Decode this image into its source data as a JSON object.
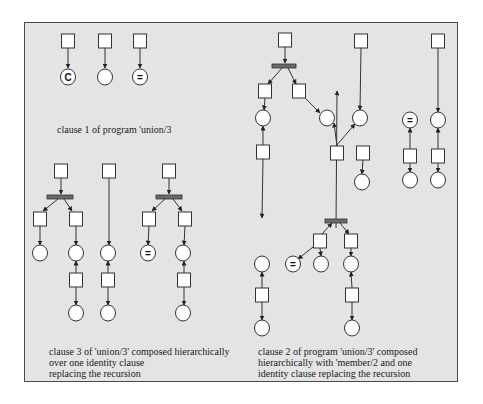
{
  "colors": {
    "frame_bg": "#e4e4e4",
    "stroke": "#333333",
    "node_fill": "#ffffff",
    "bar_fill": "#6a6a6a"
  },
  "captions": {
    "clause1": {
      "lines": [
        "clause 1 of program 'union/3"
      ],
      "x": 57,
      "y": 124
    },
    "clause3": {
      "lines": [
        "clause 3  of 'union/3' composed hierarchically",
        "over one identity clause",
        "replacing the recursion"
      ],
      "x": 49,
      "y": 346
    },
    "clause2": {
      "lines": [
        "clause 2 of program 'union/3' composed",
        "hierarchically with 'member/2 and one",
        "identity clause replacing the recursion"
      ],
      "x": 258,
      "y": 346
    }
  },
  "diagram": {
    "boxes": [
      {
        "id": "c1b1",
        "x": 68,
        "y": 41
      },
      {
        "id": "c1b2",
        "x": 105,
        "y": 41
      },
      {
        "id": "c1b3",
        "x": 140,
        "y": 41
      },
      {
        "id": "c3b1",
        "x": 61,
        "y": 171
      },
      {
        "id": "c3b2",
        "x": 40,
        "y": 219
      },
      {
        "id": "c3b3",
        "x": 76,
        "y": 219
      },
      {
        "id": "c3b4",
        "x": 76,
        "y": 280
      },
      {
        "id": "c3b5",
        "x": 109,
        "y": 171
      },
      {
        "id": "c3b6",
        "x": 108,
        "y": 280
      },
      {
        "id": "c3b7",
        "x": 169,
        "y": 171
      },
      {
        "id": "c3b8",
        "x": 149,
        "y": 219
      },
      {
        "id": "c3b9",
        "x": 185,
        "y": 219
      },
      {
        "id": "c3b10",
        "x": 184,
        "y": 280
      },
      {
        "id": "c2b1",
        "x": 285,
        "y": 40
      },
      {
        "id": "c2b2",
        "x": 265,
        "y": 91
      },
      {
        "id": "c2b3",
        "x": 299,
        "y": 91
      },
      {
        "id": "c2b4",
        "x": 361,
        "y": 41
      },
      {
        "id": "c2b5",
        "x": 263,
        "y": 152
      },
      {
        "id": "c2b6",
        "x": 337,
        "y": 153
      },
      {
        "id": "c2b7",
        "x": 363,
        "y": 153
      },
      {
        "id": "c2b8",
        "x": 320,
        "y": 241
      },
      {
        "id": "c2b9",
        "x": 351,
        "y": 241
      },
      {
        "id": "c2b10",
        "x": 262,
        "y": 295
      },
      {
        "id": "c2b11",
        "x": 352,
        "y": 295
      },
      {
        "id": "c2b12",
        "x": 438,
        "y": 41
      },
      {
        "id": "c2b13",
        "x": 410,
        "y": 156
      },
      {
        "id": "c2b14",
        "x": 438,
        "y": 156
      }
    ],
    "circles": [
      {
        "id": "c1p1",
        "x": 68,
        "y": 77,
        "label": "C"
      },
      {
        "id": "c1p2",
        "x": 105,
        "y": 77,
        "label": ""
      },
      {
        "id": "c1p3",
        "x": 140,
        "y": 77,
        "label": "="
      },
      {
        "id": "c3p1",
        "x": 40,
        "y": 253,
        "label": ""
      },
      {
        "id": "c3p2",
        "x": 76,
        "y": 253,
        "label": ""
      },
      {
        "id": "c3p3",
        "x": 76,
        "y": 313,
        "label": ""
      },
      {
        "id": "c3p4",
        "x": 108,
        "y": 253,
        "label": ""
      },
      {
        "id": "c3p5",
        "x": 108,
        "y": 313,
        "label": ""
      },
      {
        "id": "c3p6",
        "x": 148,
        "y": 253,
        "label": "="
      },
      {
        "id": "c3p7",
        "x": 183,
        "y": 253,
        "label": ""
      },
      {
        "id": "c3p8",
        "x": 183,
        "y": 313,
        "label": ""
      },
      {
        "id": "c2p1",
        "x": 263,
        "y": 118,
        "label": ""
      },
      {
        "id": "c2p2",
        "x": 327,
        "y": 118,
        "label": ""
      },
      {
        "id": "c2p3",
        "x": 360,
        "y": 118,
        "label": ""
      },
      {
        "id": "c2p4",
        "x": 362,
        "y": 182,
        "label": ""
      },
      {
        "id": "c2p5",
        "x": 262,
        "y": 264,
        "label": ""
      },
      {
        "id": "c2p6",
        "x": 293,
        "y": 264,
        "label": "="
      },
      {
        "id": "c2p7",
        "x": 321,
        "y": 264,
        "label": ""
      },
      {
        "id": "c2p8",
        "x": 351,
        "y": 264,
        "label": ""
      },
      {
        "id": "c2p9",
        "x": 262,
        "y": 328,
        "label": ""
      },
      {
        "id": "c2p10",
        "x": 352,
        "y": 328,
        "label": ""
      },
      {
        "id": "c2p11",
        "x": 410,
        "y": 120,
        "label": "="
      },
      {
        "id": "c2p12",
        "x": 438,
        "y": 120,
        "label": ""
      },
      {
        "id": "c2p13",
        "x": 410,
        "y": 180,
        "label": ""
      },
      {
        "id": "c2p14",
        "x": 438,
        "y": 180,
        "label": ""
      }
    ],
    "bars": [
      {
        "id": "c3bar1",
        "x": 60,
        "y": 197,
        "w": 26
      },
      {
        "id": "c3bar2",
        "x": 169,
        "y": 197,
        "w": 26
      },
      {
        "id": "c2bar1",
        "x": 284,
        "y": 66,
        "w": 24
      },
      {
        "id": "c2bar2",
        "x": 336,
        "y": 221,
        "w": 22
      }
    ],
    "arcs": [
      [
        68,
        48,
        68,
        68
      ],
      [
        105,
        48,
        105,
        68
      ],
      [
        140,
        48,
        140,
        68
      ],
      [
        61,
        178,
        61,
        194
      ],
      [
        58,
        199,
        43,
        211
      ],
      [
        64,
        199,
        72,
        211
      ],
      [
        40,
        226,
        40,
        245
      ],
      [
        76,
        226,
        76,
        245
      ],
      [
        76,
        273,
        76,
        261
      ],
      [
        76,
        287,
        76,
        305
      ],
      [
        109,
        178,
        109,
        245
      ],
      [
        108,
        273,
        108,
        261
      ],
      [
        108,
        287,
        108,
        305
      ],
      [
        169,
        178,
        169,
        194
      ],
      [
        165,
        199,
        152,
        211
      ],
      [
        173,
        199,
        182,
        211
      ],
      [
        149,
        226,
        148,
        245
      ],
      [
        185,
        226,
        184,
        245
      ],
      [
        184,
        273,
        184,
        261
      ],
      [
        184,
        287,
        184,
        305
      ],
      [
        285,
        47,
        285,
        63
      ],
      [
        282,
        68,
        268,
        84
      ],
      [
        288,
        68,
        296,
        84
      ],
      [
        265,
        98,
        264,
        110
      ],
      [
        263,
        145,
        263,
        126
      ],
      [
        305,
        98,
        320,
        113
      ],
      [
        361,
        48,
        360,
        110
      ],
      [
        337,
        146,
        334,
        123
      ],
      [
        336,
        146,
        355,
        124
      ],
      [
        363,
        160,
        362,
        174
      ],
      [
        263,
        159,
        262,
        218
      ],
      [
        336,
        228,
        337,
        91
      ],
      [
        322,
        234,
        332,
        223
      ],
      [
        340,
        223,
        349,
        234
      ],
      [
        313,
        247,
        298,
        259
      ],
      [
        320,
        248,
        321,
        256
      ],
      [
        351,
        248,
        351,
        256
      ],
      [
        262,
        288,
        262,
        272
      ],
      [
        262,
        302,
        262,
        320
      ],
      [
        352,
        288,
        351,
        272
      ],
      [
        352,
        302,
        352,
        320
      ],
      [
        438,
        48,
        438,
        112
      ],
      [
        410,
        149,
        410,
        128
      ],
      [
        410,
        163,
        410,
        172
      ],
      [
        438,
        149,
        438,
        128
      ],
      [
        438,
        163,
        438,
        172
      ]
    ]
  }
}
